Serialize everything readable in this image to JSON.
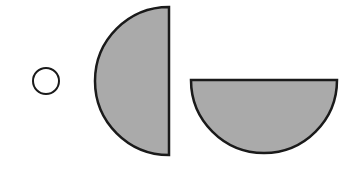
{
  "diagram": {
    "background": "#ffffff",
    "stroke_color": "#1a1a1a",
    "fill_color": "#aaaaaa",
    "shapes": [
      {
        "id": "small-circle",
        "type": "circle",
        "cx": 46,
        "cy": 81,
        "r": 13,
        "filled": false,
        "stroke_width": 2
      },
      {
        "id": "left-half-disc",
        "type": "half-disc",
        "orientation": "left",
        "cx": 169,
        "cy": 81,
        "r": 74,
        "filled": true,
        "stroke_width": 2.5
      },
      {
        "id": "bottom-half-disc",
        "type": "half-disc",
        "orientation": "bottom",
        "cx": 264,
        "cy": 80,
        "r": 73,
        "filled": true,
        "stroke_width": 2.5
      }
    ]
  }
}
